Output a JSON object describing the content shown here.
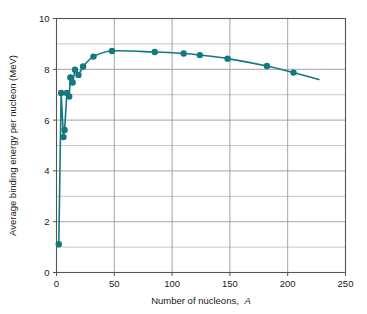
{
  "chart_data": {
    "type": "line",
    "title": "",
    "xlabel": "Number of nucleons, A",
    "xlabel_plain": "Number of nucleons,",
    "xlabel_italic": "A",
    "ylabel": "Average binding energy per nucleon (MeV)",
    "xlim": [
      0,
      250
    ],
    "ylim": [
      0,
      10
    ],
    "xticks": [
      0,
      50,
      100,
      150,
      200,
      250
    ],
    "xtick_labels": [
      "0",
      "50",
      "100",
      "150",
      "200",
      "250"
    ],
    "yticks": [
      0,
      2,
      4,
      6,
      8,
      10
    ],
    "ytick_labels": [
      "0",
      "2",
      "4",
      "6",
      "8",
      "10"
    ],
    "y_minor_ticks": [
      1,
      3,
      5,
      7,
      9
    ],
    "grid": true,
    "grid_axis": "both",
    "legend": false,
    "legend_position": "none",
    "series_color": "#13787f",
    "marker": "circle",
    "marker_size": 3.2,
    "line_width": 1.6,
    "curve_extends_beyond_last_marker": true,
    "curve_end_x": 227,
    "curve_end_y": 7.6,
    "series": [
      {
        "name": "Average binding energy per nucleon",
        "x": [
          2,
          4,
          6,
          7,
          9,
          11,
          12,
          14,
          16,
          19,
          23,
          32,
          48,
          85,
          110,
          124,
          148,
          182,
          205
        ],
        "y": [
          1.11,
          7.07,
          5.33,
          5.61,
          7.07,
          6.93,
          7.68,
          7.48,
          7.98,
          7.78,
          8.11,
          8.5,
          8.72,
          8.68,
          8.62,
          8.56,
          8.42,
          8.13,
          7.87
        ],
        "values": [
          1.11,
          7.07,
          5.33,
          5.61,
          7.07,
          6.93,
          7.68,
          7.48,
          7.98,
          7.78,
          8.11,
          8.5,
          8.72,
          8.68,
          8.62,
          8.56,
          8.42,
          8.13,
          7.87
        ]
      }
    ]
  }
}
